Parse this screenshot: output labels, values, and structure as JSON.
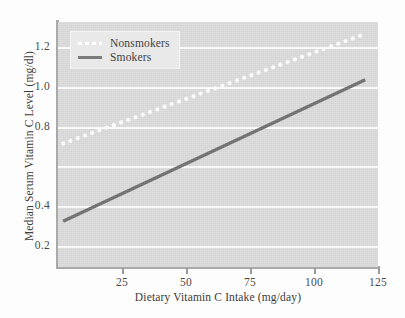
{
  "chart_data": {
    "type": "line",
    "title": "",
    "xlabel": "Dietary Vitamin C Intake (mg/day)",
    "ylabel": "Median Serum Vitamin C Level (mg/dl)",
    "xlim": [
      0,
      125
    ],
    "ylim": [
      0.1,
      1.33
    ],
    "xticks": [
      25,
      50,
      75,
      100,
      125
    ],
    "xtick_labels": [
      "25",
      "50",
      "75",
      "100",
      "125"
    ],
    "yticks": [
      0.2,
      0.4,
      0.6,
      0.8,
      1.0,
      1.2
    ],
    "ytick_labels": [
      "0.2",
      "0.4",
      "",
      "0.8",
      "1.0",
      "1.2"
    ],
    "grid": "horizontal",
    "grid_color": "#ffffff",
    "plot_background": "#dcdcdc",
    "legend_position": "upper-left",
    "series": [
      {
        "name": "Nonsmokers",
        "style": "dotted",
        "color": "#ffffff",
        "x": [
          2,
          120
        ],
        "y": [
          0.72,
          1.27
        ]
      },
      {
        "name": "Smokers",
        "style": "solid",
        "color": "#6f6f6f",
        "x": [
          2,
          120
        ],
        "y": [
          0.33,
          1.04
        ]
      }
    ]
  },
  "legend": {
    "items": [
      {
        "label": "Nonsmokers"
      },
      {
        "label": "Smokers"
      }
    ]
  }
}
